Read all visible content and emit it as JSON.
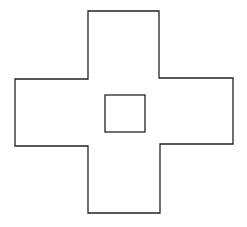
{
  "diagram": {
    "background": "#ffffff",
    "stroke": "#222222",
    "stroke_width": 1.3,
    "cross_outline": {
      "points": "88,11 159,11 159,78 233,78 233,144 160,144 160,213 88,213 88,146 15,146 15,79 88,79"
    },
    "inner_square": {
      "x": 105,
      "y": 95,
      "width": 40,
      "height": 37
    }
  }
}
